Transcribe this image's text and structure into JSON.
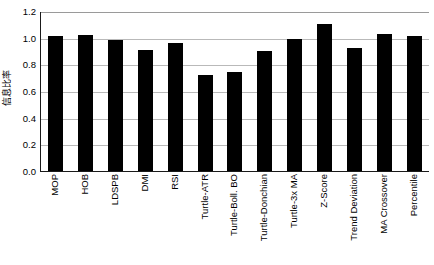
{
  "chart_data": {
    "type": "bar",
    "title": "",
    "subtitle": "",
    "xlabel": "",
    "ylabel": "信息比率",
    "ylim": [
      0.0,
      1.2
    ],
    "ytick_labels": [
      "1.2",
      "1.0",
      "0.8",
      "0.6",
      "0.4",
      "0.2",
      "0.0"
    ],
    "ytick_values": [
      1.2,
      1.0,
      0.8,
      0.6,
      0.4,
      0.2,
      0.0
    ],
    "grid": "horizontal",
    "legend": "none",
    "bar_color": "#000000",
    "plot_background": "#ffffff",
    "gridline_color": "#b9b9b9",
    "axis_color": "#1a1a1a",
    "categories": [
      "MOP",
      "HOB",
      "LDSPB",
      "DMI",
      "RSI",
      "Turtle-ATR",
      "Turtle-Boll. BO",
      "Turtle-Donchian",
      "Turtle-3x MA",
      "Z-Score",
      "Trend Deviation",
      "MA Crossover",
      "Percentile"
    ],
    "values": [
      1.01,
      1.02,
      0.98,
      0.91,
      0.96,
      0.72,
      0.74,
      0.9,
      0.99,
      1.1,
      0.92,
      1.03,
      1.01
    ]
  }
}
